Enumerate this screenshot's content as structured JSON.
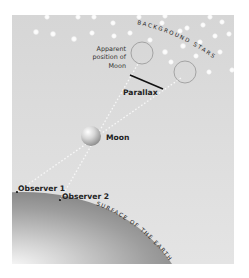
{
  "diagram": {
    "title_labels": {
      "background_stars": "BACKGROUND STARS",
      "apparent_position_line1": "Apparent",
      "apparent_position_line2": "position of",
      "apparent_position_line3": "Moon",
      "parallax": "Parallax",
      "moon": "Moon",
      "observer_1": "Observer 1",
      "observer_2": "Observer 2",
      "surface": "SURFACE OF THE EARTH"
    },
    "colors": {
      "panel": "#dcdcdc",
      "stars": "#ffffff",
      "earth_dark": "#8c8c8c",
      "earth_light": "#f2f2f2",
      "circle_stroke": "#9a9a9a",
      "parallax_line": "#111111",
      "sight_lines": "#f5f5f5"
    },
    "elements": {
      "moon": {
        "cx": 91,
        "cy": 136,
        "r": 10
      },
      "apparent_positions": [
        {
          "cx": 142,
          "cy": 53,
          "r": 11
        },
        {
          "cx": 185,
          "cy": 72,
          "r": 11
        }
      ],
      "observers": [
        {
          "name": "Observer 1",
          "x": 17,
          "y": 192
        },
        {
          "name": "Observer 2",
          "x": 60,
          "y": 200
        }
      ],
      "parallax_line": {
        "x1": 130,
        "y1": 75,
        "x2": 163,
        "y2": 89
      }
    }
  }
}
